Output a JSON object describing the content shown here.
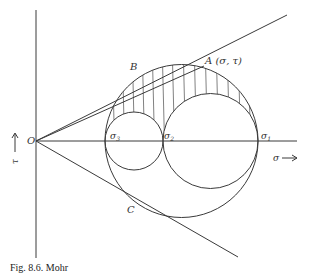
{
  "figure": {
    "type": "Mohr circle diagram (three-dimensional stress state)",
    "axes": {
      "horizontal_label": "σ",
      "vertical_label": "τ",
      "origin_label": "O"
    },
    "points": {
      "A": "A (σ, τ)",
      "B": "B",
      "C": "C"
    },
    "principal_stresses": {
      "sigma3": "σ3",
      "sigma2": "σ2",
      "sigma1": "σ1"
    },
    "circles": [
      {
        "name": "outer circle",
        "from": "σ3",
        "to": "σ1"
      },
      {
        "name": "small circle",
        "from": "σ3",
        "to": "σ2"
      },
      {
        "name": "medium circle",
        "from": "σ2",
        "to": "σ1"
      }
    ],
    "shaded_region": "area between outer circle and two inner circles (hatched)",
    "tangent_lines": [
      "OB (upper tangent)",
      "OC (lower tangent)"
    ],
    "caption": "Fig. 8.6. Mohr"
  }
}
